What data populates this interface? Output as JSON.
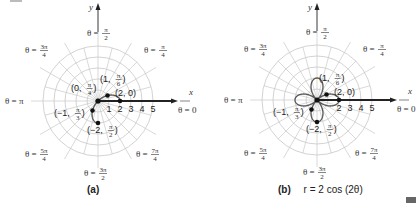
{
  "figure": {
    "panels": [
      {
        "id": "a",
        "caption_letter": "(a)",
        "caption_eq": "",
        "origin": [
          98,
          101
        ],
        "unit_px": 11,
        "rings": 5,
        "axis_x_label": "x",
        "axis_y_label": "y",
        "axis_ticks": [
          "1",
          "2",
          "3",
          "4",
          "5"
        ],
        "angle_labels": {
          "zero": "θ = 0",
          "pi_over_4": {
            "left": "θ =",
            "num": "π",
            "den": "4"
          },
          "pi_over_2": {
            "left": "θ =",
            "num": "π",
            "den": "2"
          },
          "three_pi_over_4": {
            "left": "θ =",
            "num": "3π",
            "den": "4"
          },
          "pi": "θ = π",
          "five_pi_over_4": {
            "left": "θ =",
            "num": "5π",
            "den": "4"
          },
          "three_pi_over_2": {
            "left": "θ =",
            "num": "3π",
            "den": "2"
          },
          "seven_pi_over_4": {
            "left": "θ =",
            "num": "7π",
            "den": "4"
          }
        },
        "points": [
          {
            "label": "(0, π/4)",
            "r": 0,
            "theta": "π/4"
          },
          {
            "label": "(1, π/6)",
            "r": 1,
            "theta": "π/6"
          },
          {
            "label": "(2, 0)",
            "r": 2,
            "theta": "0"
          },
          {
            "label": "(−1, π/3)",
            "r": -1,
            "theta": "π/3"
          },
          {
            "label": "(−2, π/2)",
            "r": -2,
            "theta": "π/2"
          }
        ],
        "shows_full_curve": false
      },
      {
        "id": "b",
        "caption_letter": "(b)",
        "caption_eq": "r = 2 cos (2θ)",
        "origin": [
          317,
          100
        ],
        "unit_px": 11,
        "rings": 5,
        "axis_x_label": "x",
        "axis_y_label": "y",
        "axis_ticks": [
          "2",
          "3",
          "4",
          "5"
        ],
        "angle_labels": {
          "zero": "θ = 0",
          "pi_over_4": {
            "left": "θ =",
            "num": "π",
            "den": "4"
          },
          "pi_over_2": {
            "left": "θ =",
            "num": "π",
            "den": "2"
          },
          "three_pi_over_4": {
            "left": "θ =",
            "num": "3π",
            "den": "4"
          },
          "pi": "θ = π",
          "five_pi_over_4": {
            "left": "θ =",
            "num": "5π",
            "den": "4"
          },
          "three_pi_over_2": {
            "left": "θ =",
            "num": "3π",
            "den": "2"
          },
          "seven_pi_over_4": {
            "left": "θ =",
            "num": "7π",
            "den": "4"
          }
        },
        "points": [
          {
            "label": "(1, π/6)",
            "r": 1,
            "theta": "π/6"
          },
          {
            "label": "(2, 0)",
            "r": 2,
            "theta": "0"
          },
          {
            "label": "(−1, π/3)",
            "r": -1,
            "theta": "π/3"
          },
          {
            "label": "(−2, π/2)",
            "r": -2,
            "theta": "π/2"
          }
        ],
        "shows_full_curve": true,
        "curve": "r = 2 cos (2θ)",
        "curve_type": "four-leaved rose"
      }
    ]
  },
  "colors": {
    "grid": "#c8c8c8",
    "axis": "#222222",
    "curve": "#555555",
    "point": "#111111",
    "corner_block": "#666666"
  }
}
